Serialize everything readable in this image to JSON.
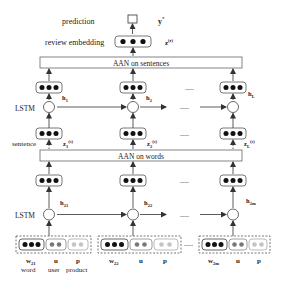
{
  "diagram": {
    "top": {
      "prediction_label": "prediction",
      "prediction_symbol": "y",
      "prediction_symbol_sup": "*",
      "review_embedding_label": "review embedding",
      "review_embedding_symbol": "z",
      "review_embedding_sup": "(r)"
    },
    "sentence_level": {
      "attention_label": "AAN on sentences",
      "lstm_label": "LSTM",
      "input_label": "sentence",
      "ellipsis": "......",
      "hidden_states": [
        {
          "base": "h",
          "sub": "1"
        },
        {
          "base": "h",
          "sub": "2"
        },
        {
          "base": "h",
          "sub": "L"
        }
      ],
      "sentence_vectors": [
        {
          "base": "z",
          "sub": "1",
          "sup": "(s)"
        },
        {
          "base": "z",
          "sub": "2",
          "sup": "(s)"
        },
        {
          "base": "z",
          "sub": "L",
          "sup": "(s)"
        }
      ]
    },
    "word_level": {
      "attention_label": "AAN on words",
      "lstm_label": "LSTM",
      "ellipsis": "......",
      "hidden_states": [
        {
          "base": "h",
          "sub": "21"
        },
        {
          "base": "h",
          "sub": "22"
        },
        {
          "base": "h",
          "sub": "2m"
        }
      ],
      "inputs": [
        {
          "word": {
            "base": "w",
            "sub": "21"
          },
          "user": "u",
          "product": "p",
          "word_caption": "word",
          "user_caption": "user",
          "product_caption": "product"
        },
        {
          "word": {
            "base": "w",
            "sub": "22"
          },
          "user": "u",
          "product": "p"
        },
        {
          "word": {
            "base": "w",
            "sub": "2m"
          },
          "user": "u",
          "product": "p"
        }
      ]
    },
    "colors": {
      "word_dot": "#111111",
      "user_dot": "#777777",
      "product_dot": "#c4c4c4",
      "stroke": "#333333"
    }
  }
}
